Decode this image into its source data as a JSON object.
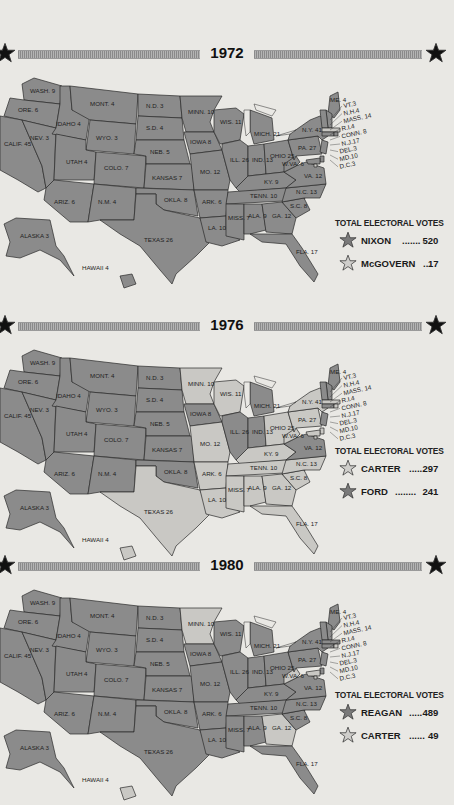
{
  "colors": {
    "background": "#e9e8e4",
    "republican_fill": "#8b8b8b",
    "democrat_fill": "#c9c8c4",
    "border": "#2a2a2a",
    "dark_star": "#7a7a7a",
    "light_star": "#cfcecb"
  },
  "chart_data": [
    {
      "type": "table",
      "title": "1972",
      "legend_title": "TOTAL ELECTORAL VOTES",
      "candidates": [
        {
          "name": "NIXON",
          "dots": ".......",
          "votes": 520,
          "star": "dark"
        },
        {
          "name": "McGOVERN",
          "dots": "...",
          "votes": 17,
          "star": "light"
        }
      ],
      "states_won_by_light": [
        "MASS.",
        "D.C."
      ]
    },
    {
      "type": "table",
      "title": "1976",
      "legend_title": "TOTAL ELECTORAL VOTES",
      "candidates": [
        {
          "name": "CARTER",
          "dots": "......",
          "votes": 297,
          "star": "light"
        },
        {
          "name": "FORD",
          "dots": "........",
          "votes": 241,
          "star": "dark"
        }
      ],
      "states_won_by_light": [
        "MINN.",
        "WIS.",
        "IOWA?",
        "MO.",
        "ARK.",
        "LA.",
        "TEXAS",
        "MISS.",
        "ALA.",
        "GA.",
        "FLA.",
        "S.C.",
        "N.C.",
        "TENN.",
        "KY.",
        "OHIO",
        "W.VA.",
        "PA.",
        "N.Y.",
        "MASS.",
        "R.I.",
        "DEL.",
        "MD.",
        "D.C.",
        "HAWAII"
      ]
    },
    {
      "type": "table",
      "title": "1980",
      "legend_title": "TOTAL ELECTORAL VOTES",
      "candidates": [
        {
          "name": "REAGAN",
          "dots": ".....",
          "votes": 489,
          "star": "dark"
        },
        {
          "name": "CARTER",
          "dots": "......",
          "votes": 49,
          "star": "light"
        }
      ],
      "states_won_by_light": [
        "MINN.",
        "W.VA.",
        "GA.",
        "MD.",
        "D.C.",
        "R.I.",
        "HAWAII"
      ]
    }
  ],
  "electoral_votes": {
    "WASH.": 9,
    "ORE.": 6,
    "CALIF.": 45,
    "NEV.": 3,
    "IDAHO": 4,
    "MONT.": 4,
    "WYO.": 3,
    "UTAH": 4,
    "ARIZ.": 6,
    "COLO.": 7,
    "N.M.": 4,
    "N.D.": 3,
    "S.D.": 4,
    "NEB.": 5,
    "KANSAS": 7,
    "OKLA.": 8,
    "TEXAS": 26,
    "MINN.": 10,
    "IOWA": 8,
    "MO.": 12,
    "ARK.": 6,
    "LA.": 10,
    "WIS.": 11,
    "ILL.": 26,
    "MICH.": 21,
    "IND.": 13,
    "OHIO": 25,
    "KY.": 9,
    "TENN.": 10,
    "MISS.": 7,
    "ALA.": 9,
    "GA.": 12,
    "FLA.": 17,
    "S.C.": 8,
    "N.C.": 13,
    "VA.": 12,
    "W.VA.": 6,
    "PA.": 27,
    "N.Y.": 41,
    "ME.": 4,
    "VT.": 3,
    "N.H.": 4,
    "MASS.": 14,
    "R.I.": 4,
    "CONN.": 8,
    "N.J.": 17,
    "DEL.": 3,
    "MD.": 10,
    "D.C.": 3,
    "ALASKA": 3,
    "HAWAII": 4
  },
  "ne_callouts": [
    "VT.3",
    "N.H.4",
    "MASS. 14",
    "R.I.4",
    "CONN. 8",
    "N.J.17",
    "DEL.3",
    "MD.10",
    "D.C.3"
  ],
  "sections": [
    {
      "year": "1972",
      "legend_title": "TOTAL ELECTORAL VOTES",
      "c1": {
        "name": "NIXON",
        "dots": ".......",
        "votes": "520"
      },
      "c2": {
        "name": "McGOVERN",
        "dots": "...",
        "votes": "17"
      }
    },
    {
      "year": "1976",
      "legend_title": "TOTAL ELECTORAL VOTES",
      "c1": {
        "name": "CARTER",
        "dots": "......",
        "votes": "297"
      },
      "c2": {
        "name": "FORD",
        "dots": "........",
        "votes": "241"
      }
    },
    {
      "year": "1980",
      "legend_title": "TOTAL ELECTORAL VOTES",
      "c1": {
        "name": "REAGAN",
        "dots": ".....",
        "votes": "489"
      },
      "c2": {
        "name": "CARTER",
        "dots": "......",
        "votes": "49"
      }
    }
  ]
}
